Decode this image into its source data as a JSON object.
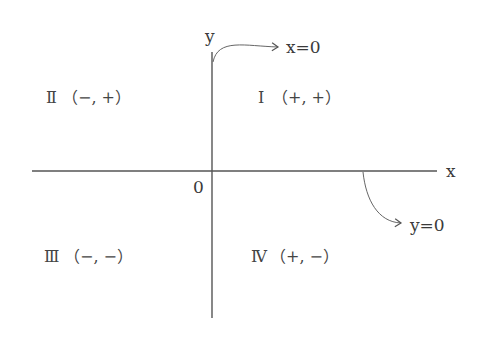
{
  "diagram": {
    "axes": {
      "x_label": "x",
      "y_label": "y",
      "origin_label": "0"
    },
    "annotations": {
      "y_axis_equation": "x=0",
      "x_axis_equation": "y=0"
    },
    "quadrants": [
      {
        "id": "I",
        "numeral": "Ⅰ",
        "signs": "（+, +）"
      },
      {
        "id": "II",
        "numeral": "Ⅱ",
        "signs": "（−, +）"
      },
      {
        "id": "III",
        "numeral": "Ⅲ",
        "signs": "（−, −）"
      },
      {
        "id": "IV",
        "numeral": "Ⅳ",
        "signs": "（+, −）"
      }
    ],
    "colors": {
      "line": "#555555",
      "text": "#3a3a3a",
      "background": "#ffffff"
    }
  }
}
